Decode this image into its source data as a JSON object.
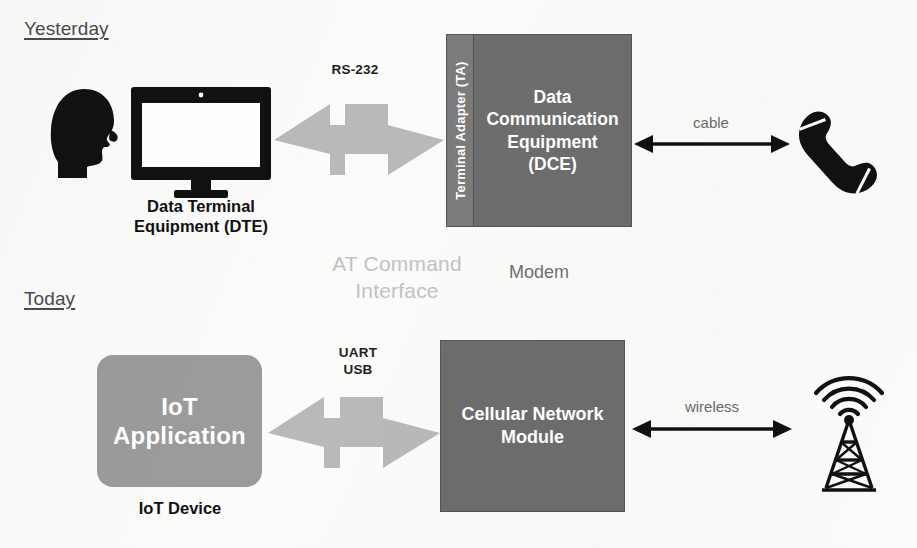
{
  "diagram": {
    "colors": {
      "box_dark_gray": "#6d6d6d",
      "ta_strip_gray": "#7b7b7b",
      "box_light_gray": "#9b9b9b",
      "arrow_gray": "#b9b9b9",
      "watermark_gray": "#c2c2c2",
      "icon_black": "#111111",
      "page_background": "#fbfbfa"
    }
  },
  "rows": {
    "yesterday": {
      "era_label": "Yesterday",
      "dte": {
        "icon_head": "head-silhouette-icon",
        "icon_monitor": "desktop-monitor-icon",
        "caption": "Data Terminal\nEquipment (DTE)"
      },
      "bus": {
        "label": "RS-232",
        "arrow": "double-headed-arrow"
      },
      "dce": {
        "ta_label": "Terminal Adapter (TA)",
        "body_label": "Data\nCommunication\nEquipment\n(DCE)",
        "caption": "Modem"
      },
      "link": {
        "label": "cable",
        "arrow": "double-headed-arrow"
      },
      "endpoint": {
        "icon": "telephone-handset-icon"
      }
    },
    "today": {
      "era_label": "Today",
      "device": {
        "body_label": "IoT\nApplication",
        "caption": "IoT Device"
      },
      "bus": {
        "label": "UART\nUSB",
        "arrow": "double-headed-arrow"
      },
      "module": {
        "body_label": "Cellular Network\nModule"
      },
      "link": {
        "label": "wireless",
        "arrow": "double-headed-arrow"
      },
      "endpoint": {
        "icon": "cell-tower-icon"
      }
    }
  },
  "center": {
    "interface_text": "AT Command\nInterface"
  }
}
